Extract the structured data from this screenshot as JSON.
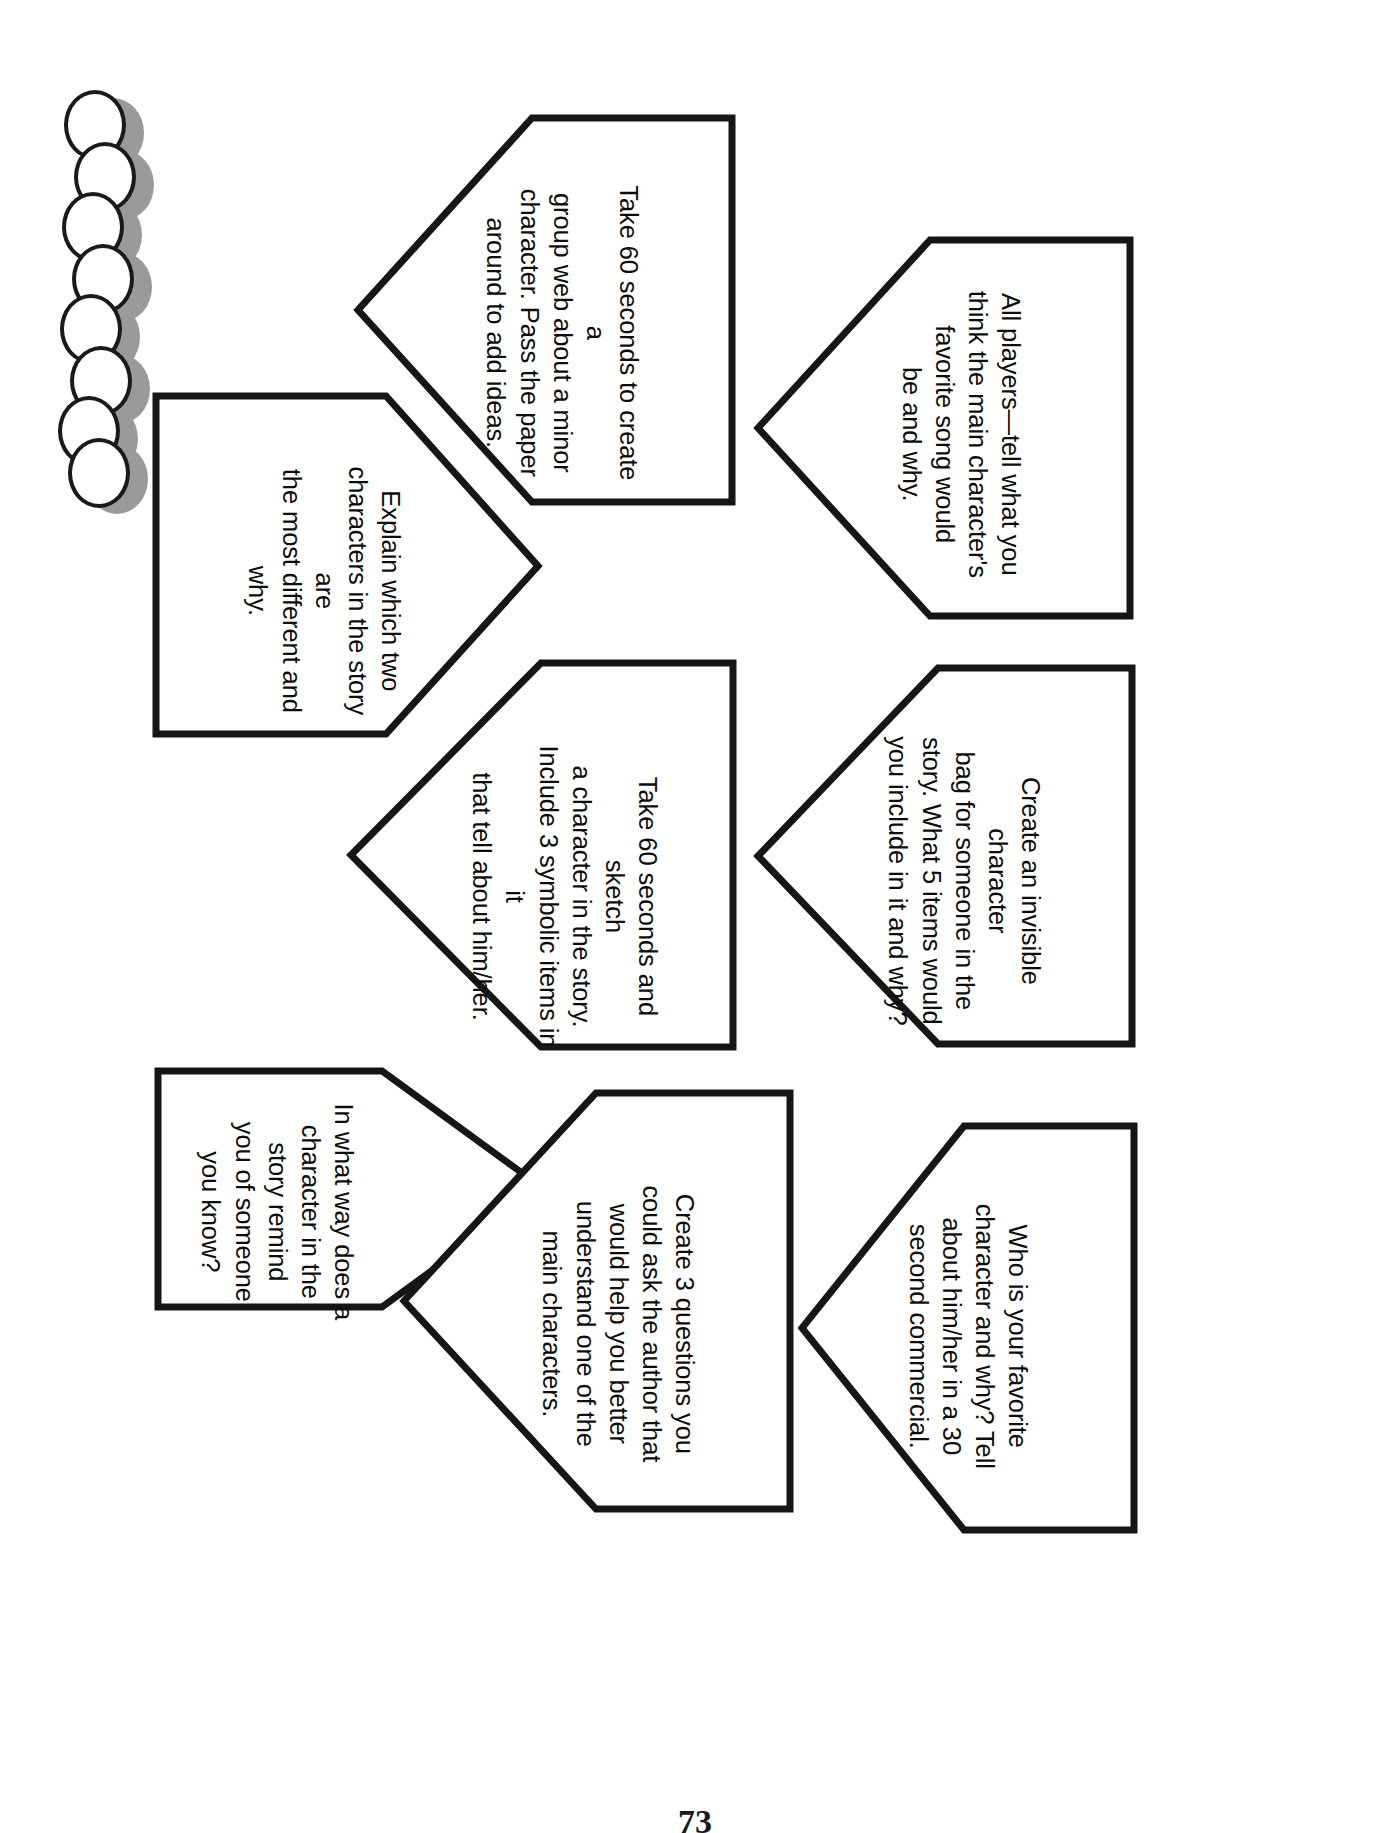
{
  "page": {
    "page_number": "73",
    "orientation": "rotated-90",
    "ink_color": "#111111",
    "shadow_color": "#9a9a9a",
    "paper_color": "#ffffff"
  },
  "decoration": {
    "name": "circle-chain",
    "circle_count": 8,
    "outline_color": "#1a1a1a",
    "shadow_color": "#9a9a9a"
  },
  "cards": [
    {
      "id": "create-group-web",
      "text": "Take 60 seconds to create a\ngroup web about a minor\ncharacter. Pass the paper\naround to add ideas."
    },
    {
      "id": "favorite-song",
      "text": "All players—tell what you\nthink the main character's\nfavorite song would\nbe and why."
    },
    {
      "id": "most-different-characters",
      "text": "Explain which two\ncharacters in the story are\nthe most different and why."
    },
    {
      "id": "sketch-character",
      "text": "Take 60 seconds and sketch\na character in the story.\nInclude 3 symbolic items in it\nthat tell about him/her."
    },
    {
      "id": "invisible-character-bag",
      "text": "Create an invisible character\nbag for someone in the\nstory. What 5 items would\nyou include in it and why?"
    },
    {
      "id": "remind-someone-you-know",
      "text": "In what way does a\ncharacter in the story remind\nyou of someone you know?"
    },
    {
      "id": "questions-for-author",
      "text": "Create 3 questions you\ncould ask the author that\nwould help you better\nunderstand one of the\nmain characters."
    },
    {
      "id": "favorite-character-commercial",
      "text": "Who is your favorite\ncharacter and why? Tell\nabout him/her in a 30\nsecond commercial."
    }
  ]
}
